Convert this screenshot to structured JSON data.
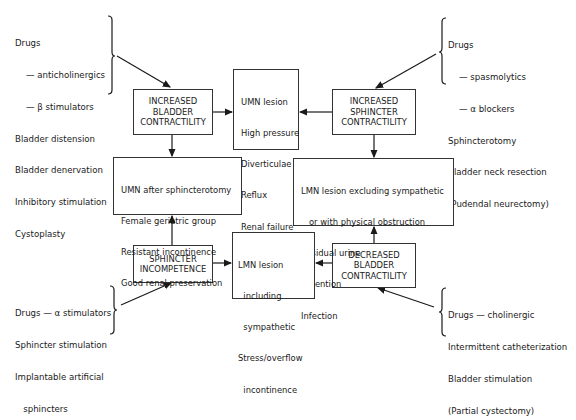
{
  "causes": {
    "top_left": [
      "Drugs",
      "    — anticholinergics",
      "    — β stimulators",
      "Bladder distension",
      "Bladder denervation",
      "Inhibitory stimulation",
      "Cystoplasty"
    ],
    "top_right": [
      "Drugs",
      "    — spasmolytics",
      "    — α blockers",
      "Sphincterotomy",
      "Bladder neck resection",
      "(Pudendal neurectomy)"
    ],
    "bottom_left": [
      "Drugs — α stimulators",
      "Sphincter stimulation",
      "Implantable artificial",
      "   sphincters"
    ],
    "bottom_right": [
      "Drugs — cholinergic",
      "Intermittent catheterization",
      "Bladder stimulation",
      "(Partial cystectomy)"
    ]
  },
  "states": {
    "increased_bladder": "INCREASED\nBLADDER\nCONTRACTILITY",
    "increased_sphincter": "INCREASED\nSPHINCTER\nCONTRACTILITY",
    "sphincter_incompetence": "SPHINCTER\nINCOMPETENCE",
    "decreased_bladder": "DECREASED\nBLADDER\nCONTRACTILITY"
  },
  "outcomes": {
    "center_top": [
      "UMN lesion",
      "High pressure",
      "Diverticulae",
      "Reflux",
      "Renal failure",
      "Dyssynergia"
    ],
    "left_middle": [
      "UMN after sphincterotomy",
      "Female geriatric group",
      "Resistant incontinence",
      "Good renal preservation"
    ],
    "right_middle": [
      "LMN lesion excluding sympathetic",
      "   or with physical obstruction",
      "Residual urine",
      "Retention",
      "Infection"
    ],
    "center_bottom": [
      "LMN lesion",
      "  including",
      "  sympathetic",
      "Stress/overflow",
      "  incontinence"
    ]
  }
}
